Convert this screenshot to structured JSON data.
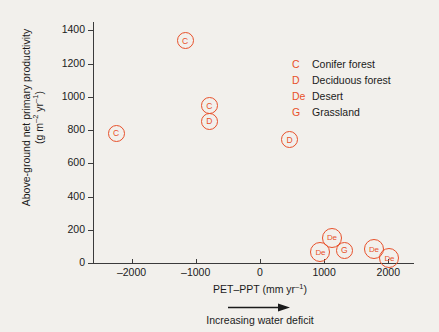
{
  "chart_data": {
    "type": "scatter",
    "title": "",
    "xlabel": "PET-PPT (mm yr-1)",
    "ylabel": "Above-ground net primary productivity (g m-2 yr-1)",
    "xlim": [
      -2600,
      2400
    ],
    "ylim": [
      0,
      1450
    ],
    "xticks": [
      -2000,
      -1000,
      0,
      1000,
      2000
    ],
    "xtick_labels": [
      "–2000",
      "–1000",
      "0",
      "1000",
      "2000"
    ],
    "yticks": [
      0,
      200,
      400,
      600,
      800,
      1000,
      1200,
      1400
    ],
    "ytick_labels": [
      "0",
      "200",
      "400",
      "600",
      "800",
      "1000",
      "1200",
      "1400"
    ],
    "grid": false,
    "legend_position": "upper right",
    "annotation": "Increasing water deficit",
    "marker_color": "#e8502a",
    "points": [
      {
        "label": "C",
        "x": -2240,
        "y": 782
      },
      {
        "label": "C",
        "x": -1165,
        "y": 1336
      },
      {
        "label": "C",
        "x": -790,
        "y": 945
      },
      {
        "label": "D",
        "x": -790,
        "y": 852
      },
      {
        "label": "D",
        "x": 460,
        "y": 742
      },
      {
        "label": "De",
        "x": 940,
        "y": 64
      },
      {
        "label": "De",
        "x": 1120,
        "y": 152
      },
      {
        "label": "G",
        "x": 1315,
        "y": 76
      },
      {
        "label": "De",
        "x": 1775,
        "y": 82
      },
      {
        "label": "De",
        "x": 2015,
        "y": 28
      }
    ],
    "legend": [
      {
        "key": "C",
        "label": "Conifer forest"
      },
      {
        "key": "D",
        "label": "Deciduous forest"
      },
      {
        "key": "De",
        "label": "Desert"
      },
      {
        "key": "G",
        "label": "Grassland"
      }
    ]
  },
  "axis": {
    "y_title_line1": "Above-ground net primary productivity",
    "y_title_line2_prefix": "(g m",
    "y_title_line2_exp1": "–2",
    "y_title_line2_mid": " yr",
    "y_title_line2_exp2": "–1",
    "y_title_line2_suffix": ")",
    "x_title_prefix": "PET–PPT (mm yr",
    "x_title_exp": "–1",
    "x_title_suffix": ")",
    "deficit_note": "Increasing water deficit"
  }
}
